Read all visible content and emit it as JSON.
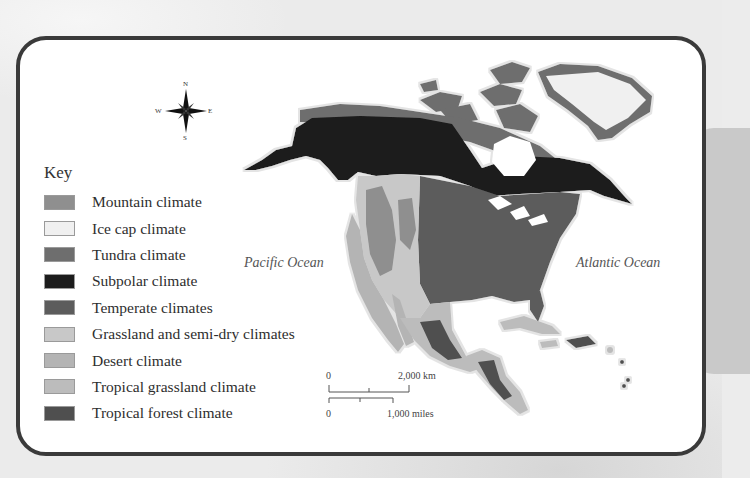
{
  "map": {
    "title": "North America climate zones",
    "compass": {
      "n": "N",
      "s": "S",
      "e": "E",
      "w": "W"
    },
    "key": {
      "title": "Key",
      "items": [
        {
          "label": "Mountain climate",
          "color": "#8f8f8f"
        },
        {
          "label": "Ice cap climate",
          "color": "#f0f0f0"
        },
        {
          "label": "Tundra climate",
          "color": "#6e6e6e"
        },
        {
          "label": "Subpolar climate",
          "color": "#1c1c1c"
        },
        {
          "label": "Temperate climates",
          "color": "#5c5c5c"
        },
        {
          "label": "Grassland and semi-dry climates",
          "color": "#c8c8c8"
        },
        {
          "label": "Desert climate",
          "color": "#b4b4b4"
        },
        {
          "label": "Tropical grassland climate",
          "color": "#bcbcbc"
        },
        {
          "label": "Tropical forest climate",
          "color": "#4f4f4f"
        }
      ]
    },
    "labels": {
      "pacific": "Pacific Ocean",
      "atlantic": "Atlantic Ocean"
    },
    "scale": {
      "km_zero": "0",
      "km_label": "2,000 km",
      "mi_zero": "0",
      "mi_label": "1,000 miles"
    }
  }
}
